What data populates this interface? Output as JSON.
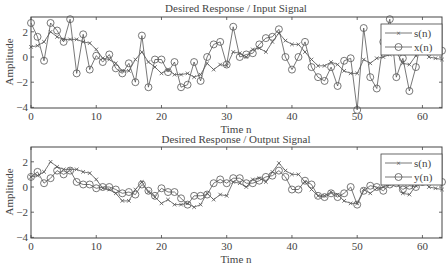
{
  "chart_data": [
    {
      "type": "line",
      "title": "Desired Response / Input Signal",
      "xlabel": "Time n",
      "ylabel": "Amplitude",
      "xlim": [
        0,
        63
      ],
      "ylim": [
        -4.2,
        3.2
      ],
      "xticks": [
        0,
        10,
        20,
        30,
        40,
        50,
        60
      ],
      "yticks": [
        2,
        0,
        -2,
        -4
      ],
      "grid": false,
      "legend_position": "upper right",
      "series": [
        {
          "name": "s(n)",
          "marker": "x",
          "values": [
            0.8,
            0.9,
            1.2,
            2.0,
            1.6,
            1.4,
            1.4,
            1.4,
            1.2,
            1.1,
            0.6,
            -0.1,
            -0.2,
            -0.5,
            -1.1,
            -1.1,
            -0.2,
            0.4,
            -0.4,
            -0.8,
            -1.3,
            -1.0,
            -1.4,
            -1.4,
            -1.3,
            -1.6,
            -1.4,
            -0.5,
            -1.0,
            -0.6,
            -0.7,
            0.4,
            0.3,
            0.0,
            0.6,
            0.7,
            0.4,
            1.2,
            1.9,
            1.3,
            1.0,
            1.0,
            0.4,
            -0.2,
            -0.7,
            -0.7,
            -0.4,
            -0.6,
            -1.1,
            -1.3,
            -1.3,
            -0.2,
            -0.5,
            -0.1,
            0.0,
            0.2,
            0.4,
            -0.5,
            -0.6,
            0.1,
            0.6,
            0.0,
            -0.1,
            -0.2
          ]
        },
        {
          "name": "x(n)",
          "marker": "o",
          "values": [
            2.7,
            1.6,
            -0.3,
            2.7,
            2.1,
            1.2,
            3.0,
            -1.3,
            1.8,
            -1.0,
            0.1,
            -0.4,
            0.2,
            -0.9,
            -1.3,
            -0.5,
            -2.0,
            1.7,
            -2.4,
            -0.2,
            -0.2,
            -1.2,
            -0.4,
            -2.4,
            -2.2,
            -0.4,
            -1.9,
            0.0,
            1.0,
            1.2,
            -0.6,
            2.4,
            0.0,
            0.2,
            0.3,
            1.0,
            1.5,
            1.6,
            2.2,
            0.0,
            -1.0,
            0.0,
            1.2,
            -0.8,
            -1.6,
            -1.9,
            -0.8,
            -2.3,
            -0.3,
            -0.1,
            -4.2,
            2.3,
            -1.6,
            -2.5,
            1.2,
            3.0,
            -1.6,
            -0.1,
            -2.7,
            -0.8,
            2.0,
            0.8,
            0.7,
            0.5
          ]
        }
      ]
    },
    {
      "type": "line",
      "title": "Desired Response / Output Signal",
      "xlabel": "Time n",
      "ylabel": "Amplitude",
      "xlim": [
        0,
        63
      ],
      "ylim": [
        -4.2,
        3.2
      ],
      "xticks": [
        0,
        10,
        20,
        30,
        40,
        50,
        60
      ],
      "yticks": [
        2,
        0,
        -2,
        -4
      ],
      "grid": false,
      "legend_position": "upper right",
      "series": [
        {
          "name": "s(n)",
          "marker": "x",
          "values": [
            0.8,
            0.9,
            1.2,
            2.0,
            1.6,
            1.4,
            1.4,
            1.4,
            1.2,
            1.1,
            0.6,
            -0.1,
            -0.2,
            -0.5,
            -1.1,
            -1.1,
            -0.2,
            0.4,
            -0.4,
            -0.8,
            -1.3,
            -1.0,
            -1.4,
            -1.4,
            -1.3,
            -1.6,
            -1.4,
            -0.5,
            -1.0,
            -0.6,
            -0.7,
            0.4,
            0.3,
            0.0,
            0.6,
            0.7,
            0.4,
            1.2,
            1.9,
            1.3,
            1.0,
            1.0,
            0.4,
            -0.2,
            -0.7,
            -0.7,
            -0.4,
            -0.6,
            -1.1,
            -1.3,
            -1.3,
            -0.2,
            -0.5,
            -0.1,
            0.0,
            0.2,
            0.4,
            -0.5,
            -0.6,
            0.1,
            0.6,
            0.0,
            -0.1,
            -0.2
          ]
        },
        {
          "name": "y(n)",
          "marker": "o",
          "values": [
            0.8,
            1.2,
            0.3,
            0.7,
            1.3,
            1.0,
            1.3,
            0.4,
            0.2,
            0.2,
            -0.1,
            0.0,
            0.0,
            -0.2,
            -0.5,
            -0.4,
            -0.6,
            0.2,
            -0.3,
            -0.7,
            -0.1,
            -0.4,
            -0.4,
            -0.9,
            -1.4,
            -0.7,
            -0.7,
            -0.6,
            0.3,
            0.6,
            0.3,
            0.7,
            0.7,
            0.3,
            0.3,
            0.5,
            0.8,
            0.9,
            1.3,
            0.8,
            -0.2,
            -0.2,
            0.5,
            0.2,
            -0.7,
            -0.8,
            -0.5,
            -0.8,
            -0.5,
            0.0,
            -1.4,
            -0.3,
            0.1,
            0.0,
            -0.3,
            0.2,
            0.3,
            -0.2,
            0.1,
            0.0,
            0.4,
            0.8,
            0.7,
            0.4
          ]
        }
      ]
    }
  ],
  "plots": [
    {
      "title": "Desired Response / Input Signal",
      "xlabel": "Time n",
      "ylabel": "Amplitude",
      "legend": [
        "s(n)",
        "x(n)"
      ]
    },
    {
      "title": "Desired Response / Output Signal",
      "xlabel": "Time n",
      "ylabel": "Amplitude",
      "legend": [
        "s(n)",
        "y(n)"
      ]
    }
  ],
  "colors": {
    "line": "#555555",
    "axis": "#444444",
    "background": "#ffffff"
  }
}
